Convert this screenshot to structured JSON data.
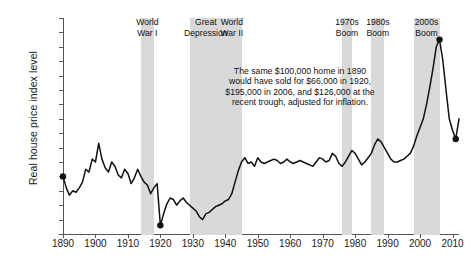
{
  "chart_data": {
    "type": "line",
    "title": "",
    "xlabel": "",
    "ylabel": "Real house price index level",
    "xlim": [
      1890,
      2012
    ],
    "ylim": [
      60,
      210
    ],
    "grid": false,
    "legend": "none",
    "ytick_labels": [
      "210",
      "200",
      "190",
      "180",
      "170",
      "160",
      "150",
      "140",
      "130",
      "120",
      "110",
      "100",
      "90",
      "80",
      "70",
      "60"
    ],
    "ytick_values": [
      210,
      200,
      190,
      180,
      170,
      160,
      150,
      140,
      130,
      120,
      110,
      100,
      90,
      80,
      70,
      60
    ],
    "xtick_labels": [
      "1890",
      "1900",
      "1910",
      "1920",
      "1930",
      "1940",
      "1950",
      "1960",
      "1970",
      "1980",
      "1990",
      "2000",
      "2010"
    ],
    "xtick_values": [
      1890,
      1900,
      1910,
      1920,
      1930,
      1940,
      1950,
      1960,
      1970,
      1980,
      1990,
      2000,
      2010
    ],
    "series": [
      {
        "name": "Real house price index",
        "x": [
          1890,
          1891,
          1892,
          1893,
          1894,
          1895,
          1896,
          1897,
          1898,
          1899,
          1900,
          1901,
          1902,
          1903,
          1904,
          1905,
          1906,
          1907,
          1908,
          1909,
          1910,
          1911,
          1912,
          1913,
          1914,
          1915,
          1916,
          1917,
          1918,
          1919,
          1920,
          1921,
          1922,
          1923,
          1924,
          1925,
          1926,
          1927,
          1928,
          1929,
          1930,
          1931,
          1932,
          1933,
          1934,
          1935,
          1936,
          1937,
          1938,
          1939,
          1940,
          1941,
          1942,
          1943,
          1944,
          1945,
          1946,
          1947,
          1948,
          1949,
          1950,
          1951,
          1952,
          1953,
          1954,
          1955,
          1956,
          1957,
          1958,
          1959,
          1960,
          1961,
          1962,
          1963,
          1964,
          1965,
          1966,
          1967,
          1968,
          1969,
          1970,
          1971,
          1972,
          1973,
          1974,
          1975,
          1976,
          1977,
          1978,
          1979,
          1980,
          1981,
          1982,
          1983,
          1984,
          1985,
          1986,
          1987,
          1988,
          1989,
          1990,
          1991,
          1992,
          1993,
          1994,
          1995,
          1996,
          1997,
          1998,
          1999,
          2000,
          2001,
          2002,
          2003,
          2004,
          2005,
          2006,
          2007,
          2008,
          2009,
          2010,
          2011,
          2012
        ],
        "y": [
          100,
          92,
          87,
          90,
          89,
          92,
          96,
          105,
          103,
          112,
          110,
          123,
          112,
          106,
          103,
          110,
          107,
          101,
          99,
          105,
          102,
          95,
          99,
          105,
          100,
          96,
          94,
          88,
          92,
          95,
          66,
          74,
          81,
          85,
          84,
          80,
          83,
          85,
          82,
          80,
          78,
          76,
          72,
          70,
          74,
          75,
          77,
          79,
          80,
          81,
          83,
          84,
          88,
          96,
          104,
          110,
          113,
          109,
          110,
          107,
          113,
          110,
          109,
          110,
          111,
          112,
          111,
          109,
          110,
          112,
          110,
          109,
          110,
          111,
          110,
          109,
          108,
          107,
          110,
          113,
          112,
          110,
          111,
          116,
          114,
          109,
          107,
          110,
          114,
          118,
          116,
          112,
          108,
          110,
          113,
          116,
          122,
          126,
          124,
          120,
          116,
          112,
          110,
          110,
          111,
          112,
          114,
          116,
          121,
          128,
          134,
          140,
          150,
          162,
          175,
          190,
          195,
          181,
          160,
          140,
          132,
          126,
          140
        ],
        "annotated_points": [
          {
            "x": 1890,
            "y": 100
          },
          {
            "x": 1920,
            "y": 66
          },
          {
            "x": 2006,
            "y": 195
          },
          {
            "x": 2011,
            "y": 126
          }
        ]
      }
    ],
    "bands": [
      {
        "id": "world-war-i",
        "label": "World\nWar I",
        "start": 1914,
        "end": 1918
      },
      {
        "id": "great-depression",
        "label": "Great\nDepression",
        "start": 1929,
        "end": 1939
      },
      {
        "id": "world-war-ii",
        "label": "World\nWar II",
        "start": 1939,
        "end": 1945
      },
      {
        "id": "boom-1970s",
        "label": "1970s\nBoom",
        "start": 1976,
        "end": 1979
      },
      {
        "id": "boom-1980s",
        "label": "1980s\nBoom",
        "start": 1985,
        "end": 1989
      },
      {
        "id": "boom-2000s",
        "label": "2000s\nBoom",
        "start": 1998,
        "end": 2006
      }
    ],
    "annotations": [
      {
        "id": "price-note",
        "text": "The same $100,000 home in 1890 would have sold for $66,000 in 1920, $195,000 in 2006, and $126,000 at the recent trough, adjusted for inflation."
      }
    ]
  }
}
